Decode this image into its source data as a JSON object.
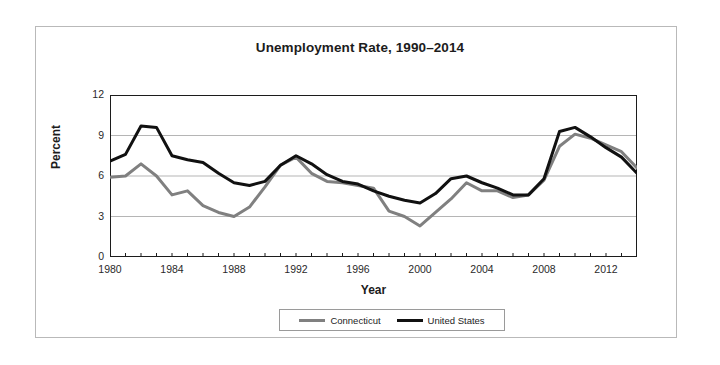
{
  "chart_data": {
    "type": "line",
    "title": "Unemployment Rate, 1990–2014",
    "xlabel": "Year",
    "ylabel": "Percent",
    "xlim": [
      1980,
      2014
    ],
    "ylim": [
      0,
      12
    ],
    "yticks": [
      0,
      3,
      6,
      9,
      12
    ],
    "xticks": [
      1980,
      1984,
      1988,
      1992,
      1996,
      2000,
      2004,
      2008,
      2012
    ],
    "xtick_labels": [
      "1980",
      "1984",
      "1988",
      "1992",
      "1996",
      "2000",
      "2004",
      "2008",
      "2012"
    ],
    "ytick_labels": [
      "0",
      "3",
      "6",
      "9",
      "12"
    ],
    "x_minor_tick_step": 1,
    "grid": "horizontal",
    "legend_position": "bottom-center",
    "x": [
      1980,
      1981,
      1982,
      1983,
      1984,
      1985,
      1986,
      1987,
      1988,
      1989,
      1990,
      1991,
      1992,
      1993,
      1994,
      1995,
      1996,
      1997,
      1998,
      1999,
      2000,
      2001,
      2002,
      2003,
      2004,
      2005,
      2006,
      2007,
      2008,
      2009,
      2010,
      2011,
      2012,
      2013,
      2014
    ],
    "series": [
      {
        "name": "Connecticut",
        "color": "#808080",
        "values": [
          5.9,
          6.0,
          6.9,
          6.0,
          4.6,
          4.9,
          3.8,
          3.3,
          3.0,
          3.7,
          5.2,
          6.8,
          7.4,
          6.2,
          5.6,
          5.5,
          5.3,
          5.1,
          3.4,
          3.0,
          2.3,
          3.3,
          4.3,
          5.5,
          4.9,
          4.9,
          4.4,
          4.6,
          5.7,
          8.2,
          9.1,
          8.8,
          8.3,
          7.8,
          6.6
        ],
        "peak": {
          "year": 2010,
          "value": 9.1
        },
        "trough": {
          "year": 2000,
          "value": 2.3
        }
      },
      {
        "name": "United States",
        "color": "#111111",
        "values": [
          7.1,
          7.6,
          9.7,
          9.6,
          7.5,
          7.2,
          7.0,
          6.2,
          5.5,
          5.3,
          5.6,
          6.8,
          7.5,
          6.9,
          6.1,
          5.6,
          5.4,
          4.9,
          4.5,
          4.2,
          4.0,
          4.7,
          5.8,
          6.0,
          5.5,
          5.1,
          4.6,
          4.6,
          5.8,
          9.3,
          9.6,
          8.9,
          8.1,
          7.4,
          6.2
        ],
        "peak": {
          "year": 1982,
          "value": 9.7
        },
        "trough": {
          "year": 2000,
          "value": 4.0
        }
      }
    ],
    "legend": [
      {
        "label": "Connecticut",
        "color": "#808080"
      },
      {
        "label": "United States",
        "color": "#111111"
      }
    ]
  }
}
